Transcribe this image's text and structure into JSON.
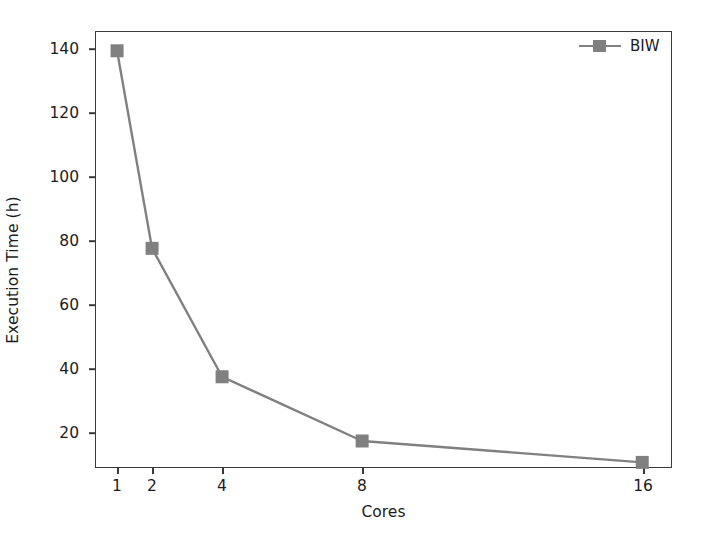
{
  "chart_data": {
    "type": "line",
    "title": "",
    "xlabel": "Cores",
    "ylabel": "Execution Time (h)",
    "x": [
      1,
      2,
      4,
      8,
      16
    ],
    "xtick_labels": [
      "1",
      "2",
      "4",
      "8",
      "16"
    ],
    "ytick_labels": [
      "20",
      "40",
      "60",
      "80",
      "100",
      "120",
      "140"
    ],
    "yticks": [
      20,
      40,
      60,
      80,
      100,
      120,
      140
    ],
    "xlim": [
      0.37,
      16.85
    ],
    "ylim": [
      13.3,
      146.0
    ],
    "grid": false,
    "legend_position": "upper right",
    "series": [
      {
        "name": "BIW",
        "values": [
          140.0,
          80.0,
          41.0,
          21.5,
          15.0
        ],
        "color": "#808080",
        "marker": "square",
        "linewidth": 2.4
      }
    ]
  },
  "legend": {
    "entries": [
      {
        "label": "BIW",
        "color": "#808080"
      }
    ]
  },
  "axes": {
    "spine_color": "#3a3a3a",
    "text_color": "#1c1c1c",
    "background": "#ffffff"
  }
}
